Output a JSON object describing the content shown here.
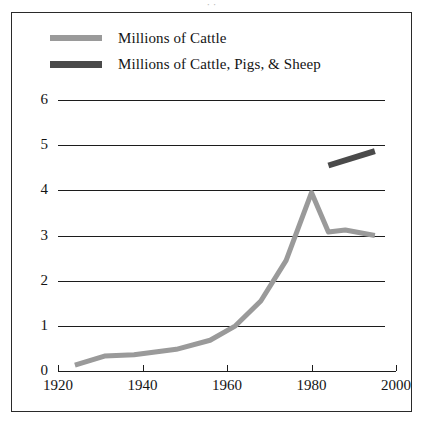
{
  "figure": {
    "title_sliver": "· ·",
    "background": "#ffffff",
    "border_color": "#2a2a2a"
  },
  "legend": {
    "position": "top-left-inside",
    "entries": [
      {
        "label": "Millions of Cattle",
        "color": "#9a9a9a",
        "weight": "thin"
      },
      {
        "label": "Millions of Cattle, Pigs, & Sheep",
        "color": "#4a4a4a",
        "weight": "thick"
      }
    ]
  },
  "chart_data": {
    "type": "line",
    "title": "",
    "xlabel": "",
    "ylabel": "",
    "xlim": [
      1920,
      2000
    ],
    "ylim": [
      0,
      6
    ],
    "xticks": [
      1920,
      1940,
      1960,
      1980,
      2000
    ],
    "yticks": [
      0,
      1,
      2,
      3,
      4,
      5,
      6
    ],
    "xtick_labels": [
      "1920",
      "1940",
      "1960",
      "1980",
      "2000"
    ],
    "ytick_labels": [
      "0",
      "1",
      "2",
      "3",
      "4",
      "5",
      "6"
    ],
    "grid": "horizontal",
    "legend_position": "upper left",
    "series": [
      {
        "name": "Millions of Cattle",
        "color": "#9a9a9a",
        "linewidth": 5,
        "x": [
          1924,
          1931,
          1938,
          1948,
          1956,
          1962,
          1968,
          1974,
          1980,
          1984,
          1988,
          1995
        ],
        "values": [
          0.13,
          0.33,
          0.36,
          0.48,
          0.68,
          1.0,
          1.55,
          2.45,
          3.95,
          3.08,
          3.12,
          3.0
        ]
      },
      {
        "name": "Millions of Cattle, Pigs, & Sheep",
        "color": "#4a4a4a",
        "linewidth": 6,
        "x": [
          1984,
          1995
        ],
        "values": [
          4.55,
          4.87
        ]
      }
    ]
  }
}
